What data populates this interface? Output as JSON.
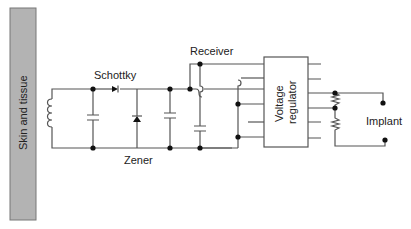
{
  "diagram": {
    "type": "circuit-schematic",
    "tissue_bar": {
      "label": "Skin and tissue",
      "color": "#b3b3b3"
    },
    "labels": {
      "schottky": "Schottky",
      "zener": "Zener",
      "receiver": "Receiver",
      "regulator_line1": "Voltage",
      "regulator_line2": "regulator",
      "implant": "Implant"
    },
    "components": [
      {
        "id": "coil",
        "kind": "inductor"
      },
      {
        "id": "c1",
        "kind": "capacitor"
      },
      {
        "id": "d1",
        "kind": "schottky-diode"
      },
      {
        "id": "d2",
        "kind": "zener-diode"
      },
      {
        "id": "c2",
        "kind": "capacitor"
      },
      {
        "id": "c3",
        "kind": "capacitor"
      },
      {
        "id": "u1",
        "kind": "voltage-regulator"
      },
      {
        "id": "r1",
        "kind": "resistor"
      },
      {
        "id": "r2",
        "kind": "resistor"
      },
      {
        "id": "load",
        "kind": "implant"
      }
    ],
    "colors": {
      "wire": "#555555",
      "node": "#111111"
    }
  }
}
